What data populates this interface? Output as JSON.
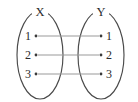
{
  "diagram": {
    "type": "set-mapping-diagram",
    "background_color": "#ffffff",
    "outline_color": "#4a4a4a",
    "connector_color": "#9a9a9a",
    "dot_color": "#3a3a3a",
    "text_color": "#2b2b2b",
    "sets": [
      {
        "name": "domain-set",
        "label": "X",
        "label_x": 40,
        "label_y": 15,
        "center_x": 40,
        "center_y": 55,
        "radius_x": 23,
        "radius_y": 44,
        "side": "left",
        "elements": [
          {
            "label": "1",
            "dot_x": 36,
            "dot_y": 36,
            "label_x": 31,
            "label_y": 40
          },
          {
            "label": "2",
            "dot_x": 36,
            "dot_y": 55,
            "label_x": 31,
            "label_y": 59
          },
          {
            "label": "3",
            "dot_x": 36,
            "dot_y": 74,
            "label_x": 31,
            "label_y": 78
          }
        ]
      },
      {
        "name": "codomain-set",
        "label": "Y",
        "label_x": 101,
        "label_y": 15,
        "center_x": 101,
        "center_y": 55,
        "radius_x": 23,
        "radius_y": 44,
        "side": "right",
        "elements": [
          {
            "label": "1",
            "dot_x": 101,
            "dot_y": 36,
            "label_x": 106,
            "label_y": 40
          },
          {
            "label": "2",
            "dot_x": 101,
            "dot_y": 55,
            "label_x": 106,
            "label_y": 59
          },
          {
            "label": "3",
            "dot_x": 101,
            "dot_y": 74,
            "label_x": 106,
            "label_y": 78
          }
        ]
      }
    ],
    "connections": [
      {
        "from": "X.1",
        "to": "Y.1",
        "x1": 38,
        "y1": 36,
        "x2": 99,
        "y2": 36
      },
      {
        "from": "X.2",
        "to": "Y.2",
        "x1": 38,
        "y1": 55,
        "x2": 99,
        "y2": 55
      },
      {
        "from": "X.3",
        "to": "Y.3",
        "x1": 38,
        "y1": 74,
        "x2": 99,
        "y2": 74
      }
    ]
  }
}
